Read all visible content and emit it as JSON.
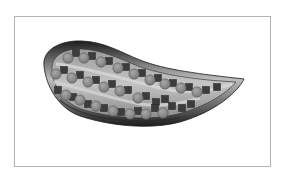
{
  "figure": {
    "colors": {
      "frame_border": "#b4b4b4",
      "tray_dark": "#2a2a2a",
      "tray_mid": "#6e6e6e",
      "tray_light": "#c8c8c8",
      "circle_fill": "#8c8c8c",
      "square_fill": "#3c3c3c",
      "groove": "#b9b9b9"
    },
    "rows": [
      {
        "name": "row-top",
        "circles": [
          [
            68,
            58
          ],
          [
            84,
            58
          ],
          [
            101,
            62
          ],
          [
            118,
            68
          ],
          [
            134,
            74
          ],
          [
            150,
            80
          ],
          [
            165,
            84
          ],
          [
            181,
            88
          ],
          [
            197,
            92
          ]
        ],
        "squares": [
          [
            76,
            53
          ],
          [
            92,
            56
          ],
          [
            109,
            61
          ],
          [
            126,
            67
          ],
          [
            142,
            73
          ],
          [
            158,
            78
          ],
          [
            173,
            83
          ],
          [
            189,
            87
          ],
          [
            206,
            90
          ],
          [
            217,
            87
          ]
        ]
      },
      {
        "name": "row-middle",
        "circles": [
          [
            56,
            74
          ],
          [
            72,
            78
          ],
          [
            88,
            82
          ],
          [
            104,
            87
          ],
          [
            120,
            91
          ],
          [
            138,
            98
          ]
        ],
        "squares": [
          [
            64,
            70
          ],
          [
            80,
            75
          ],
          [
            96,
            80
          ],
          [
            112,
            84
          ],
          [
            128,
            90
          ],
          [
            146,
            96
          ],
          [
            156,
            102
          ],
          [
            165,
            99
          ]
        ]
      },
      {
        "name": "row-bottom",
        "circles": [
          [
            66,
            95
          ],
          [
            80,
            100
          ],
          [
            96,
            106
          ],
          [
            113,
            111
          ],
          [
            130,
            114
          ],
          [
            146,
            114
          ],
          [
            163,
            113
          ]
        ],
        "squares": [
          [
            58,
            90
          ],
          [
            73,
            97
          ],
          [
            88,
            104
          ],
          [
            104,
            108
          ],
          [
            121,
            112
          ],
          [
            138,
            111
          ],
          [
            155,
            108
          ],
          [
            172,
            106
          ],
          [
            182,
            108
          ],
          [
            191,
            104
          ]
        ]
      }
    ],
    "tip": {
      "x": 244,
      "y": 80
    }
  }
}
